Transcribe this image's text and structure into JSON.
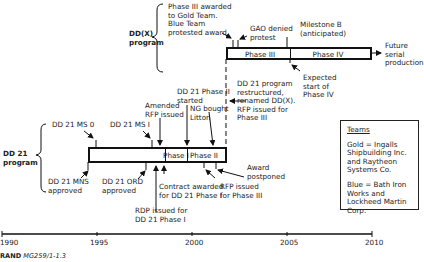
{
  "programs": {
    "ddx": {
      "label_line1": "DD(X)",
      "label_line2": "program"
    },
    "dd21": {
      "label_line1": "DD 21",
      "label_line2": "program"
    }
  },
  "bars": {
    "dd21": {
      "phase1": "Phase I",
      "phase2": "Phase II"
    },
    "ddx": {
      "phase3": "Phase III",
      "phase4": "Phase IV"
    }
  },
  "annotations": {
    "phase3_awarded": [
      "Phase III awarded",
      "to Gold Team.",
      "Blue Team",
      "protested award"
    ],
    "gao": [
      "GAO denied",
      "protest"
    ],
    "milestone_b": [
      "Milestone B",
      "(anticipated)"
    ],
    "future": [
      "Future",
      "serial",
      "production"
    ],
    "expected_phase4": [
      "Expected",
      "start of",
      "Phase IV"
    ],
    "restructured": [
      "DD 21 program",
      "restructured,",
      "renamed DD(X).",
      "RFP issued for",
      "Phase III"
    ],
    "dd21_phase2_started": [
      "DD 21 Phase II",
      "started"
    ],
    "ng_bought": [
      "NG bought",
      "Litton"
    ],
    "amended_rfp": [
      "Amended",
      "RFP issued"
    ],
    "ms0": "DD 21 MS 0",
    "ms1": "DD 21 MS I",
    "mns": [
      "DD 21 MNS",
      "approved"
    ],
    "ord": [
      "DD 21 ORD",
      "approved"
    ],
    "rdp": [
      "RDP issued for",
      "DD 21 Phase I"
    ],
    "contract": [
      "Contract awarded",
      "for DD 21 Phase I"
    ],
    "rfp_phase3": [
      "RFP issued",
      "for Phase III"
    ],
    "award_postponed": [
      "Award",
      "postponed"
    ]
  },
  "teams": {
    "title": "Teams",
    "gold": "Gold = Ingalls Shipbuilding Inc. and Raytheon Systems Co.",
    "blue": "Blue = Bath Iron Works and Lockheed Martin Corp."
  },
  "axis": {
    "ticks": [
      "1990",
      "1995",
      "2000",
      "2005",
      "2010"
    ]
  },
  "footer": {
    "brand": "RAND",
    "code": "MG259/1-1.3"
  }
}
